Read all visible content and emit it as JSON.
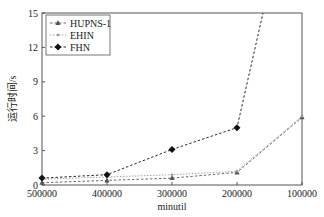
{
  "chart_data": {
    "type": "line",
    "title": "",
    "xlabel": "minutil",
    "ylabel": "运行时间/s",
    "x": [
      500000,
      400000,
      300000,
      200000,
      100000
    ],
    "x_tick_labels": [
      "500000",
      "400000",
      "300000",
      "200000",
      "100000"
    ],
    "x_reversed": true,
    "xlim": [
      500000,
      100000
    ],
    "ylim": [
      0,
      15
    ],
    "y_ticks": [
      0,
      3,
      6,
      9,
      12,
      15
    ],
    "y_tick_labels": [
      "0",
      "3",
      "6",
      "9",
      "12",
      "15"
    ],
    "grid": false,
    "legend_position": "upper left",
    "series": [
      {
        "name": "HUPNS-1",
        "marker": "triangle",
        "color": "#555555",
        "line_style": "dashed",
        "values": [
          0.2,
          0.4,
          0.6,
          1.1,
          5.9
        ]
      },
      {
        "name": "EHIN",
        "marker": "small-dot",
        "color": "#9a9a9a",
        "line_style": "dotted",
        "values": [
          0.5,
          0.7,
          0.9,
          1.2,
          6.0
        ]
      },
      {
        "name": "FHN",
        "marker": "diamond",
        "color": "#111111",
        "line_style": "dashed",
        "values": [
          0.6,
          0.9,
          3.1,
          5.0,
          null
        ],
        "note": "continues above 15 s (off chart) between 200000 and 100000"
      }
    ]
  }
}
